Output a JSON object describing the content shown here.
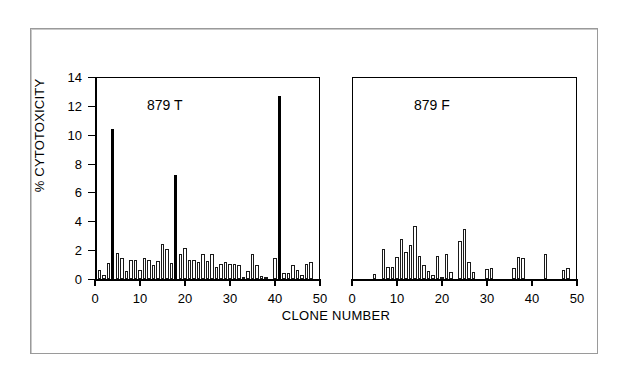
{
  "figure": {
    "background_color": "#ffffff",
    "frame_color": "#9a9a9a",
    "axis_color": "#000000",
    "bar_outline_color": "#1a1a1a",
    "bar_fill_open": "#ffffff",
    "bar_fill_solid": "#000000"
  },
  "chart_data": {
    "type": "bar",
    "title": "",
    "xlabel": "CLONE NUMBER",
    "ylabel": "% CYTOTOXICITY",
    "ylim": [
      0,
      14
    ],
    "xlim": [
      0,
      50
    ],
    "yticks": [
      0,
      2,
      4,
      6,
      8,
      10,
      12,
      14
    ],
    "ytick_labels": [
      "0",
      "2",
      "4",
      "6",
      "8",
      "10",
      "12",
      "14"
    ],
    "xticks": [
      0,
      10,
      20,
      30,
      40,
      50
    ],
    "xtick_labels": [
      "0",
      "10",
      "20",
      "30",
      "40",
      "50"
    ],
    "grid": false,
    "legend": null,
    "panels": [
      {
        "label": "879 T",
        "x": [
          1,
          2,
          3,
          4,
          5,
          6,
          7,
          8,
          9,
          10,
          11,
          12,
          13,
          14,
          15,
          16,
          17,
          18,
          19,
          20,
          21,
          22,
          23,
          24,
          25,
          26,
          27,
          28,
          29,
          30,
          31,
          32,
          33,
          34,
          35,
          36,
          37,
          38,
          39,
          40,
          41,
          42,
          43,
          44,
          45,
          46,
          47,
          48
        ],
        "values": [
          0.65,
          0.25,
          1.1,
          10.4,
          1.8,
          1.45,
          0.55,
          1.35,
          1.3,
          0.6,
          1.45,
          1.35,
          0.95,
          1.25,
          2.45,
          2.05,
          1.1,
          7.2,
          1.7,
          2.15,
          1.35,
          1.3,
          1.15,
          1.75,
          1.25,
          1.7,
          0.8,
          1.05,
          1.2,
          1.05,
          1.05,
          1.0,
          0.15,
          0.55,
          1.75,
          0.95,
          0.2,
          0.05,
          0.0,
          1.45,
          12.65,
          0.4,
          0.4,
          0.95,
          0.6,
          0.25,
          1.05,
          1.2
        ],
        "solid_indices": [
          4,
          18,
          41
        ],
        "peak_values": {
          "4": 10.4,
          "18": 7.2,
          "41": 12.65
        }
      },
      {
        "label": "879 F",
        "x": [
          1,
          2,
          3,
          4,
          5,
          6,
          7,
          8,
          9,
          10,
          11,
          12,
          13,
          14,
          15,
          16,
          17,
          18,
          19,
          20,
          21,
          22,
          23,
          24,
          25,
          26,
          27,
          28,
          29,
          30,
          31,
          32,
          33,
          34,
          35,
          36,
          37,
          38,
          39,
          40,
          41,
          42,
          43,
          44,
          45,
          46,
          47,
          48
        ],
        "values": [
          0.0,
          0.0,
          0.0,
          0.0,
          0.35,
          0.0,
          2.05,
          0.85,
          0.8,
          1.5,
          2.75,
          1.9,
          2.35,
          3.7,
          1.6,
          1.0,
          0.55,
          0.3,
          1.6,
          0.15,
          1.7,
          0.5,
          0.0,
          2.65,
          3.5,
          1.2,
          0.5,
          0.0,
          0.0,
          0.7,
          0.75,
          0.0,
          0.0,
          0.0,
          0.0,
          0.75,
          1.5,
          1.45,
          0.0,
          0.0,
          0.0,
          0.0,
          1.7,
          0.0,
          0.0,
          0.0,
          0.65,
          0.75
        ],
        "solid_indices": [],
        "peak_values": {
          "14": 3.7,
          "25": 3.5
        }
      }
    ]
  }
}
